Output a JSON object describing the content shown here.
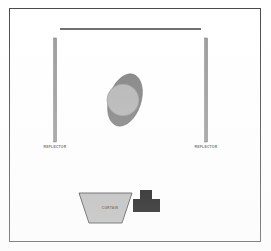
{
  "diagram": {
    "frame": {
      "border_color": "#4a4a4a",
      "background_color": "#ffffff"
    },
    "top_rail": {
      "name": "top-rail",
      "color": "#3a3a3a",
      "x1": 60,
      "y1": 29,
      "x2": 201,
      "y2": 29,
      "thickness": 1.4
    },
    "reflectors": [
      {
        "label": "REFLECTOR",
        "side": "left",
        "x": 55,
        "y_top": 38,
        "y_bottom": 142,
        "width": 2.6,
        "fill_color": "#9a9a9a",
        "stroke_color": "#6e6e6e"
      },
      {
        "label": "REFLECTOR",
        "side": "right",
        "x": 206,
        "y_top": 38,
        "y_bottom": 142,
        "width": 2.6,
        "fill_color": "#9a9a9a",
        "stroke_color": "#6e6e6e"
      }
    ],
    "center_figure": {
      "ellipse": {
        "name": "tilted-ellipse",
        "cx": 125,
        "cy": 100,
        "rx": 16,
        "ry": 27,
        "rotation_deg": 18,
        "fill_color": "#808080",
        "stroke_color": "#6a6a6a"
      },
      "circle": {
        "name": "overlay-circle",
        "cx": 123,
        "cy": 100,
        "r": 16,
        "fill_color": "#b4b4b4",
        "stroke_color": "#8c8c8c"
      }
    },
    "curtain": {
      "label": "CURTAIN",
      "fill_color": "#b8b8b8",
      "stroke_color": "#3a3a3a",
      "points": "79,193 132,193 122,223 89,223"
    },
    "black_block": {
      "name": "t-shaped-block",
      "fill_color": "#000000",
      "points": "140,190 152,190 152,199 160,199 160,212 133,212 133,199 140,199"
    }
  }
}
